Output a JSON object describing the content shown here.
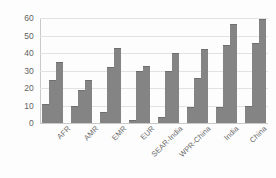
{
  "chart_data": {
    "type": "bar",
    "title": "",
    "subtitle": "",
    "xlabel": "",
    "ylabel": "",
    "ylim": [
      0,
      60
    ],
    "ytick_labels": [
      "0",
      "10",
      "20",
      "30",
      "40",
      "50",
      "60"
    ],
    "yticks": [
      0,
      10,
      20,
      30,
      40,
      50,
      60
    ],
    "grid": true,
    "legend": "none",
    "categories": [
      "AFR",
      "AMR",
      "EMR",
      "EUR",
      "SEAR-India",
      "WPR-China",
      "India",
      "China"
    ],
    "series": [
      {
        "name": "Series 1",
        "values": [
          11,
          9.5,
          6.5,
          1.5,
          3.5,
          9,
          9,
          10
        ]
      },
      {
        "name": "Series 2",
        "values": [
          24.5,
          19,
          32,
          30,
          30,
          25.5,
          44.5,
          46
        ]
      },
      {
        "name": "Series 3",
        "values": [
          35,
          24.5,
          43,
          32.5,
          40,
          42.5,
          56.5,
          59.5
        ]
      }
    ],
    "colors": {
      "bar": "#848484",
      "bar_edge": "#6f6f6f",
      "gridline": "#e2e2e2",
      "axis": "#c9c9c9",
      "tick_text": "#636363",
      "background": "#fdfdfd"
    }
  }
}
